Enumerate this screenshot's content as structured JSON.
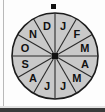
{
  "figure": {
    "kind": "spinner-wheel",
    "sector_count": 12,
    "colors": {
      "sector_fill": "#c9c9c9",
      "sector_stroke": "#2b2b2b",
      "rim_stroke": "#1c1c1c",
      "label_color": "#111111",
      "hub_color": "#111111",
      "pointer_color": "#111111",
      "page_background": "#fdfdfd",
      "edge_rule": "#b9b9b9",
      "bottom_band": "#3a3a3a"
    },
    "hub": {
      "name": "center-hub",
      "shape": "square",
      "size_px": 6
    },
    "pointer": {
      "name": "pointer-dot",
      "shape": "square",
      "position": "top",
      "size_px": 5
    }
  },
  "chart_data": {
    "type": "pie",
    "title": "",
    "xlabel": "",
    "ylabel": "",
    "legend_position": "none",
    "grid": false,
    "note": "Twelve equal sectors of 30 degrees each; labels read clockwise from the top, beginning with J (January) in the sector immediately clockwise of vertical.",
    "categories": [
      "J",
      "F",
      "M",
      "A",
      "M",
      "J",
      "J",
      "A",
      "S",
      "O",
      "N",
      "D"
    ],
    "values": [
      30,
      30,
      30,
      30,
      30,
      30,
      30,
      30,
      30,
      30,
      30,
      30
    ],
    "sectors": [
      {
        "label": "J",
        "month": "January",
        "start_deg": 0,
        "end_deg": 30,
        "mid_deg": 15
      },
      {
        "label": "F",
        "month": "February",
        "start_deg": 30,
        "end_deg": 60,
        "mid_deg": 45
      },
      {
        "label": "M",
        "month": "March",
        "start_deg": 60,
        "end_deg": 90,
        "mid_deg": 75
      },
      {
        "label": "A",
        "month": "April",
        "start_deg": 90,
        "end_deg": 120,
        "mid_deg": 105
      },
      {
        "label": "M",
        "month": "May",
        "start_deg": 120,
        "end_deg": 150,
        "mid_deg": 135
      },
      {
        "label": "J",
        "month": "June",
        "start_deg": 150,
        "end_deg": 180,
        "mid_deg": 165
      },
      {
        "label": "J",
        "month": "July",
        "start_deg": 180,
        "end_deg": 210,
        "mid_deg": 195
      },
      {
        "label": "A",
        "month": "August",
        "start_deg": 210,
        "end_deg": 240,
        "mid_deg": 225
      },
      {
        "label": "S",
        "month": "September",
        "start_deg": 240,
        "end_deg": 270,
        "mid_deg": 255
      },
      {
        "label": "O",
        "month": "October",
        "start_deg": 270,
        "end_deg": 300,
        "mid_deg": 285
      },
      {
        "label": "N",
        "month": "November",
        "start_deg": 300,
        "end_deg": 330,
        "mid_deg": 315
      },
      {
        "label": "D",
        "month": "December",
        "start_deg": 330,
        "end_deg": 360,
        "mid_deg": 345
      }
    ]
  }
}
